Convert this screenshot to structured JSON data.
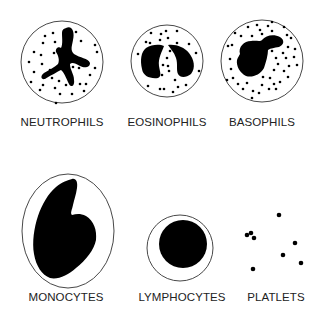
{
  "diagram": {
    "cells": [
      {
        "id": "neutrophils",
        "label": "NEUTROPHILS",
        "label_x": 62,
        "label_y": 116
      },
      {
        "id": "eosinophils",
        "label": "EOSINOPHILS",
        "label_x": 167,
        "label_y": 116
      },
      {
        "id": "basophils",
        "label": "BASOPHILS",
        "label_x": 262,
        "label_y": 116
      },
      {
        "id": "monocytes",
        "label": "MONOCYTES",
        "label_x": 66,
        "label_y": 291
      },
      {
        "id": "lymphocytes",
        "label": "LYMPHOCYTES",
        "label_x": 182,
        "label_y": 291
      },
      {
        "id": "platlets",
        "label": "PLATLETS",
        "label_x": 276,
        "label_y": 291
      }
    ],
    "colors": {
      "ink": "#000000",
      "outline": "#333333",
      "background": "#ffffff"
    }
  }
}
